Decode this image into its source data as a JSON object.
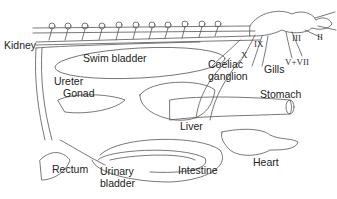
{
  "diagram": {
    "type": "anatomical-illustration",
    "stroke_color": "#555555",
    "label_color": "#222222",
    "labels": {
      "kidney": "Kidney",
      "swim_bladder": "Swim bladder",
      "ureter": "Ureter",
      "gonad": "Gonad",
      "coeliac_ganglion_line1": "Coeliac",
      "coeliac_ganglion_line2": "ganglion",
      "gills": "Gills",
      "stomach": "Stomach",
      "liver": "Liver",
      "heart": "Heart",
      "rectum": "Rectum",
      "urinary_bladder_line1": "Urinary",
      "urinary_bladder_line2": "bladder",
      "intestine": "Intestine"
    },
    "cranial_nerves": {
      "ix": "IX",
      "x": "X",
      "iii": "III",
      "ii": "II",
      "v_vii": "V+VII"
    }
  }
}
